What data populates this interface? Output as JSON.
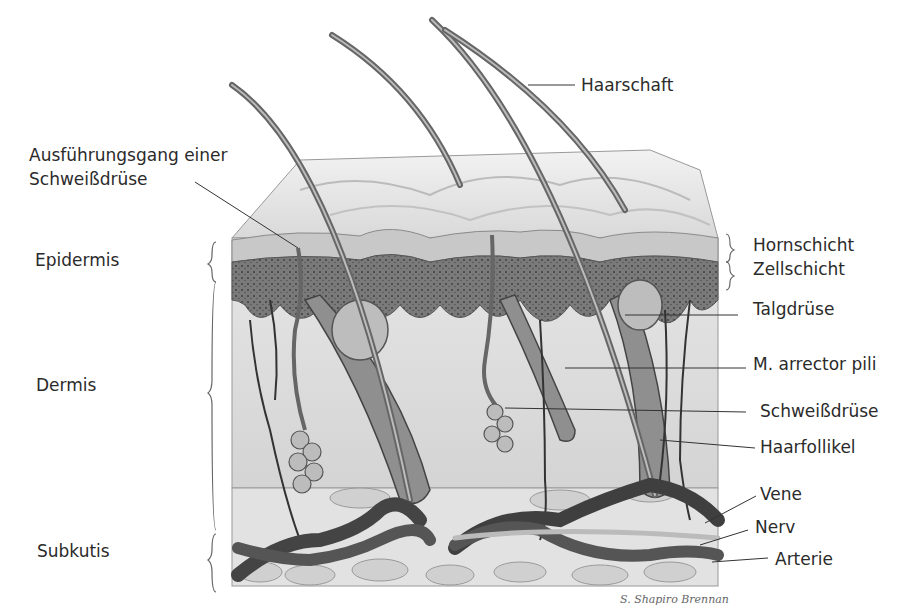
{
  "diagram": {
    "left_labels": {
      "duct": [
        "Ausführungsgang einer",
        "Schweißdrüse"
      ],
      "epidermis": "Epidermis",
      "dermis": "Dermis",
      "subkutis": "Subkutis"
    },
    "right_labels": {
      "haarschaft": "Haarschaft",
      "hornschicht": "Hornschicht",
      "zellschicht": "Zellschicht",
      "talgdruese": "Talgdrüse",
      "arrector": "M. arrector pili",
      "schweissdruese": "Schweißdrüse",
      "haarfollikel": "Haarfollikel",
      "vene": "Vene",
      "nerv": "Nerv",
      "arterie": "Arterie"
    },
    "signature": "S. Shapiro Brennan"
  }
}
